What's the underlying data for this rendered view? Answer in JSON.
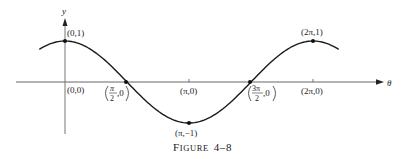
{
  "figure": {
    "caption_prefix": "F",
    "caption_small_caps": "IGURE",
    "caption_number": "4–8"
  },
  "axes": {
    "x_label": "θ",
    "y_label": "y"
  },
  "points": [
    {
      "label": "(0,1)",
      "x": 0,
      "y": 1,
      "marked": true
    },
    {
      "label": "(0,0)",
      "x": 0,
      "y": 0,
      "marked": false
    },
    {
      "label_num": "π",
      "label_den": "2",
      "label_tail": ",0",
      "x": 1.5708,
      "y": 0,
      "marked": true
    },
    {
      "label": "(π,0)",
      "x": 3.1416,
      "y": 0,
      "marked": false
    },
    {
      "label": "(π,−1)",
      "x": 3.1416,
      "y": -1,
      "marked": true
    },
    {
      "label_num": "3π",
      "label_den": "2",
      "label_tail": ",0",
      "x": 4.7124,
      "y": 0,
      "marked": true
    },
    {
      "label": "(2π,0)",
      "x": 6.2832,
      "y": 0,
      "marked": false
    },
    {
      "label": "(2π,1)",
      "x": 6.2832,
      "y": 1,
      "marked": true
    }
  ],
  "chart_data": {
    "type": "line",
    "function": "y = cos θ",
    "xlabel": "θ",
    "ylabel": "y",
    "xlim": [
      -0.8,
      7.0
    ],
    "ylim": [
      -1.1,
      1.3
    ],
    "grid": false,
    "legend": null,
    "x_ticks": [
      {
        "value": 3.1416,
        "label": "π"
      },
      {
        "value": 6.2832,
        "label": "2π"
      }
    ],
    "series": [
      {
        "name": "cos θ",
        "x": [
          -0.8,
          0,
          0.7854,
          1.5708,
          2.3562,
          3.1416,
          3.927,
          4.7124,
          5.4978,
          6.2832,
          7.0
        ],
        "values": [
          0.697,
          1,
          0.707,
          0,
          -0.707,
          -1,
          -0.707,
          0,
          0.707,
          1,
          0.754
        ]
      }
    ],
    "annotations": [
      {
        "x": 0,
        "y": 1,
        "text": "(0,1)"
      },
      {
        "x": 0,
        "y": 0,
        "text": "(0,0)"
      },
      {
        "x": 1.5708,
        "y": 0,
        "text": "(π/2,0)"
      },
      {
        "x": 3.1416,
        "y": 0,
        "text": "(π,0)"
      },
      {
        "x": 3.1416,
        "y": -1,
        "text": "(π,−1)"
      },
      {
        "x": 4.7124,
        "y": 0,
        "text": "(3π/2,0)"
      },
      {
        "x": 6.2832,
        "y": 0,
        "text": "(2π,0)"
      },
      {
        "x": 6.2832,
        "y": 1,
        "text": "(2π,1)"
      }
    ]
  }
}
